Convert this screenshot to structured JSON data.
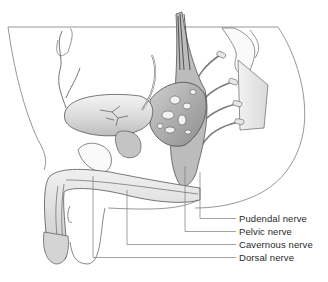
{
  "diagram": {
    "type": "anatomical-illustration",
    "labels": [
      {
        "id": "pudendal",
        "text": "Pudendal nerve"
      },
      {
        "id": "pelvic",
        "text": "Pelvic nerve"
      },
      {
        "id": "cavernous",
        "text": "Cavernous nerve"
      },
      {
        "id": "dorsal",
        "text": "Dorsal nerve"
      }
    ]
  }
}
